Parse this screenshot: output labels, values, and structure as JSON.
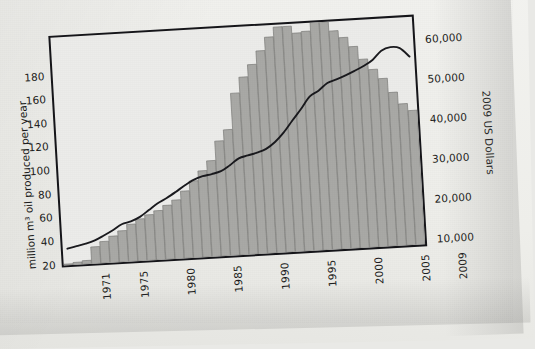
{
  "chart_data": {
    "type": "bar",
    "title": "",
    "subtitle": "",
    "xlabel": "",
    "ylabel": "million m³ oil produced per year",
    "y2label": "2009 US Dollars",
    "grid": false,
    "legend": "none",
    "xlim": [
      1971,
      2009
    ],
    "ylim": [
      0,
      190
    ],
    "y2lim": [
      5000,
      63000
    ],
    "x_tick_labels": [
      "1971",
      "1975",
      "1980",
      "1985",
      "1990",
      "1995",
      "2000",
      "2005",
      "2009"
    ],
    "x_tick_values": [
      1971,
      1975,
      1980,
      1985,
      1990,
      1995,
      2000,
      2005,
      2009
    ],
    "y_tick_labels": [
      "20",
      "40",
      "60",
      "80",
      "100",
      "120",
      "140",
      "160",
      "180"
    ],
    "y_tick_values": [
      20,
      40,
      60,
      80,
      100,
      120,
      140,
      160,
      180
    ],
    "y2_tick_labels": [
      "10,000",
      "20,000",
      "30,000",
      "40,000",
      "50,000",
      "60,000"
    ],
    "y2_tick_values": [
      10000,
      20000,
      30000,
      40000,
      50000,
      60000
    ],
    "x": [
      1971,
      1972,
      1973,
      1974,
      1975,
      1976,
      1977,
      1978,
      1979,
      1980,
      1981,
      1982,
      1983,
      1984,
      1985,
      1986,
      1987,
      1988,
      1989,
      1990,
      1991,
      1992,
      1993,
      1994,
      1995,
      1996,
      1997,
      1998,
      1999,
      2000,
      2001,
      2002,
      2003,
      2004,
      2005,
      2006,
      2007,
      2008,
      2009
    ],
    "series": [
      {
        "name": "oil produced",
        "type": "bar",
        "axis": "left",
        "units": "million m³ per year",
        "color": "#a9a9a6",
        "values": [
          1,
          2,
          3,
          14,
          18,
          22,
          26,
          31,
          35,
          38,
          41,
          45,
          49,
          56,
          64,
          72,
          80,
          96,
          105,
          135,
          148,
          158,
          169,
          180,
          188,
          188,
          182,
          183,
          190,
          190,
          182,
          176,
          168,
          157,
          148,
          140,
          128,
          118,
          112
        ]
      },
      {
        "name": "oil price",
        "type": "line",
        "axis": "right",
        "units": "2009 US Dollars",
        "color": "#1a1a1e",
        "values": [
          9200,
          9700,
          10200,
          10900,
          12000,
          13200,
          14600,
          15200,
          16200,
          17800,
          19400,
          20600,
          22000,
          23500,
          24800,
          25600,
          26000,
          26600,
          28000,
          29600,
          30200,
          30800,
          31600,
          33200,
          35500,
          38400,
          41200,
          44200,
          45600,
          47400,
          48200,
          49100,
          50100,
          51200,
          52600,
          54800,
          55600,
          55200,
          52900
        ]
      }
    ]
  }
}
